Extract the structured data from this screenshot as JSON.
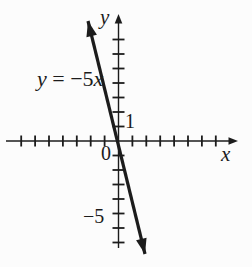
{
  "figure": {
    "background": "#fcfcfc",
    "ink_color": "#1c1c1c",
    "equation_label": {
      "lhs": "y",
      "rel": " = ",
      "coef": "−5",
      "var": "x",
      "full": "y = −5x"
    },
    "axis_labels": {
      "x": "x",
      "y": "y"
    },
    "tick_labels": {
      "x_unit": "1",
      "origin": "0",
      "y_neg5": "−5"
    }
  },
  "chart_data": {
    "type": "line",
    "equation": "y = -5x",
    "slope": -5,
    "y_intercept": 0,
    "series": [
      {
        "name": "y = -5x",
        "points": [
          [
            -1.6,
            8
          ],
          [
            -1,
            5
          ],
          [
            0,
            0
          ],
          [
            1,
            -5
          ],
          [
            1.6,
            -8
          ]
        ]
      }
    ],
    "xlabel": "x",
    "ylabel": "y",
    "xlim": [
      -8.2,
      8.6
    ],
    "ylim": [
      -8.4,
      8.8
    ],
    "x_ticks": [
      -7,
      -6,
      -5,
      -4,
      -3,
      -2,
      -1,
      1,
      2,
      3,
      4,
      5,
      6,
      7
    ],
    "y_ticks": [
      -7,
      -6,
      -5,
      -4,
      -3,
      -2,
      -1,
      1,
      2,
      3,
      4,
      5,
      6,
      7
    ],
    "labeled_ticks": [
      {
        "axis": "x",
        "value": 1,
        "label": "1"
      },
      {
        "axis": "origin",
        "value": 0,
        "label": "0"
      },
      {
        "axis": "y",
        "value": -5,
        "label": "−5"
      }
    ],
    "grid": false,
    "legend": false,
    "annotations": [
      {
        "text": "y = −5x",
        "position": "upper-left-of-line"
      }
    ]
  }
}
